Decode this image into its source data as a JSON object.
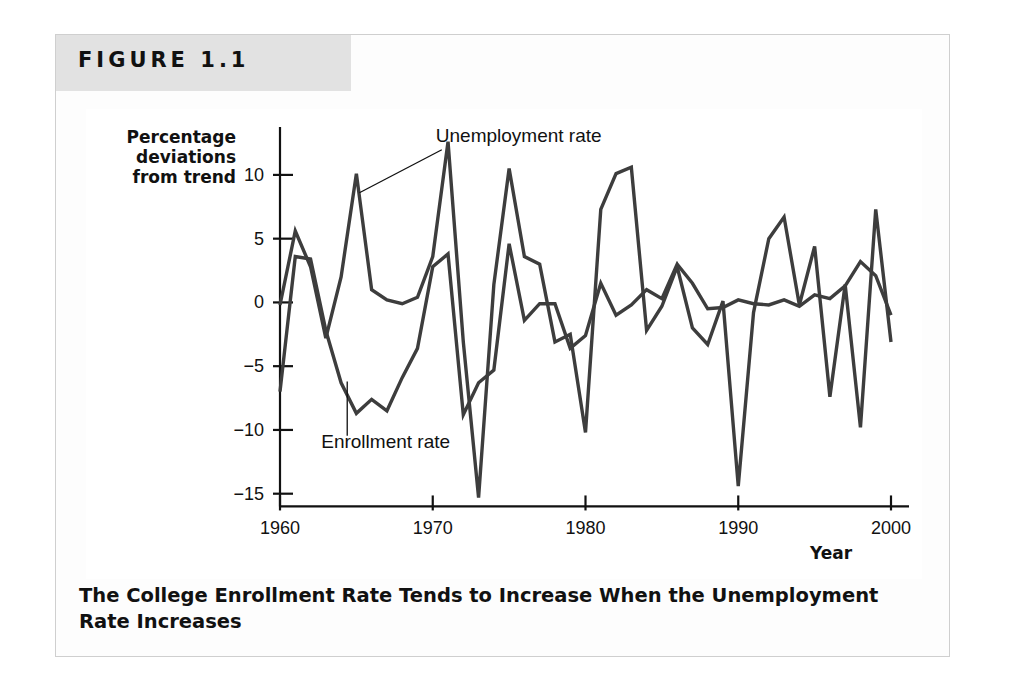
{
  "figure": {
    "number_label": "FIGURE 1.1",
    "caption": "The College Enrollment Rate Tends to Increase When the Unemployment Rate Increases"
  },
  "colors": {
    "band": "#e2e2e2",
    "page": "#fdfdfd",
    "frame_border": "#cfcfcf",
    "line": "#3d3d3d",
    "axis": "#111111",
    "text": "#111111"
  },
  "chart_data": {
    "type": "line",
    "title": "The College Enrollment Rate Tends to Increase When the Unemployment Rate Increases",
    "xlabel": "Year",
    "ylabel": "Percentage deviations from trend",
    "ylabel_lines": [
      "Percentage",
      "deviations",
      "from trend"
    ],
    "xlim": [
      1960,
      2000
    ],
    "ylim": [
      -16,
      14
    ],
    "grid": false,
    "legend": "annotations",
    "xticks": [
      1960,
      1970,
      1980,
      1990,
      2000
    ],
    "xtick_labels": [
      "1960",
      "1970",
      "1980",
      "1990",
      "2000"
    ],
    "yticks": [
      10,
      5,
      0,
      -5,
      -10,
      -15
    ],
    "ytick_labels": [
      "10",
      "5",
      "0",
      "−5",
      "−10",
      "−15"
    ],
    "annotations": [
      {
        "text": "Unemployment rate",
        "x": 1970.2,
        "y": 12.6,
        "points_to_x": 1965.2,
        "points_to_y": 8.6
      },
      {
        "text": "Enrollment rate",
        "x": 1962.7,
        "y": -11.4,
        "points_to_x": 1964.4,
        "points_to_y": -6.2
      }
    ],
    "x": [
      1960,
      1961,
      1962,
      1963,
      1964,
      1965,
      1966,
      1967,
      1968,
      1969,
      1970,
      1971,
      1972,
      1973,
      1974,
      1975,
      1976,
      1977,
      1978,
      1979,
      1980,
      1981,
      1982,
      1983,
      1984,
      1985,
      1986,
      1987,
      1988,
      1989,
      1990,
      1991,
      1992,
      1993,
      1994,
      1995,
      1996,
      1997,
      1998,
      1999,
      2000
    ],
    "series": [
      {
        "name": "Unemployment rate",
        "values": [
          -0.2,
          5.6,
          2.8,
          -2.8,
          2.0,
          10.1,
          1.0,
          0.2,
          -0.1,
          0.4,
          3.6,
          12.6,
          -3.1,
          -15.3,
          1.4,
          10.5,
          3.6,
          3.0,
          -3.1,
          -2.5,
          -10.2,
          7.3,
          10.1,
          10.6,
          -2.2,
          -0.3,
          2.8,
          -2.0,
          -3.3,
          0.1,
          -14.4,
          -0.8,
          5.0,
          6.7,
          -0.2,
          4.4,
          -7.4,
          1.4,
          -9.8,
          7.3,
          -3.1
        ]
      },
      {
        "name": "Enrollment rate",
        "values": [
          -7.0,
          3.6,
          3.4,
          -2.2,
          -6.3,
          -8.7,
          -7.6,
          -8.5,
          -5.9,
          -3.6,
          2.8,
          3.8,
          -8.8,
          -6.3,
          -5.3,
          4.6,
          -1.4,
          -0.1,
          -0.1,
          -3.6,
          -2.6,
          1.5,
          -1.0,
          -0.2,
          1.0,
          0.3,
          3.0,
          1.5,
          -0.5,
          -0.4,
          0.2,
          -0.1,
          -0.2,
          0.2,
          -0.3,
          0.6,
          0.3,
          1.3,
          3.2,
          2.1,
          -1.0
        ]
      }
    ]
  }
}
